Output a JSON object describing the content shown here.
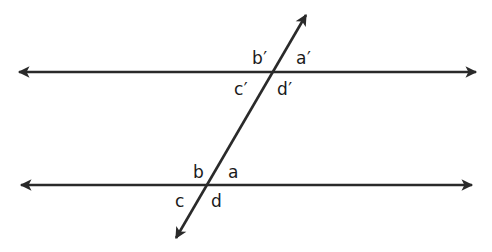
{
  "diagram": {
    "type": "parallel-lines-cut-by-transversal",
    "line_color": "#2a2a2a",
    "top_line": {
      "y": 72,
      "x1": 17,
      "x2": 478
    },
    "bottom_line": {
      "y": 185,
      "x1": 19,
      "x2": 474
    },
    "transversal": {
      "x1": 307,
      "y1": 13,
      "x2": 175,
      "y2": 240
    },
    "angle_labels": {
      "top": {
        "b": "b′",
        "a": "a′",
        "c": "c′",
        "d": "d′"
      },
      "bottom": {
        "b": "b",
        "a": "a",
        "c": "c",
        "d": "d"
      }
    }
  }
}
